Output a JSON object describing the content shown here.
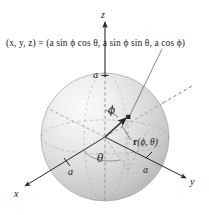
{
  "figure": {
    "type": "3d-math-diagram",
    "background_color": "#ffffff",
    "ink_color": "#1a1a1a"
  },
  "formula": {
    "lhs": "(x, y, z) =",
    "rhs": "(a sin ϕ cos θ, a sin ϕ sin θ, a cos ϕ)",
    "full": "(x, y, z) = (a sin ϕ cos θ, a sin ϕ sin θ, a cos ϕ)"
  },
  "axes": {
    "z": {
      "label": "z",
      "direction": "up"
    },
    "x": {
      "label": "x",
      "direction": "down-left"
    },
    "y": {
      "label": "y",
      "direction": "down-right"
    }
  },
  "radius_labels": {
    "z_intercept": "a",
    "x_intercept": "a",
    "y_intercept": "a"
  },
  "angles": {
    "phi": "ϕ",
    "theta": "θ"
  },
  "vector": {
    "label_bold": "r",
    "label_args": "(ϕ, θ)",
    "label_full": "r(ϕ, θ)"
  },
  "sphere": {
    "center_x": 105,
    "center_y": 137,
    "radius": 64,
    "fill_light": "#f2f2f2",
    "fill_dark": "#bdbdbd",
    "edge_color": "#9a9a9a"
  },
  "point": {
    "marker_shape": "square-dot",
    "color": "#2b2b2b"
  }
}
